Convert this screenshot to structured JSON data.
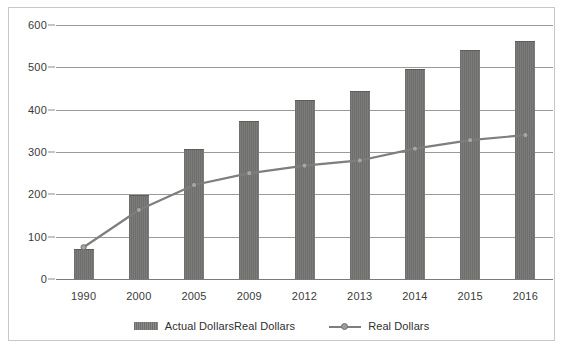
{
  "chart_data": {
    "type": "bar",
    "title": "",
    "subtitle": "",
    "xlabel": "",
    "ylabel": "",
    "categories": [
      "1990",
      "2000",
      "2005",
      "2009",
      "2012",
      "2013",
      "2014",
      "2015",
      "2016"
    ],
    "ylim": [
      0,
      600
    ],
    "yticks": [
      0,
      100,
      200,
      300,
      400,
      500,
      600
    ],
    "ytick_labels": [
      "0",
      "100",
      "200",
      "300",
      "400",
      "500",
      "600"
    ],
    "grid": true,
    "legend_position": "bottom",
    "series": [
      {
        "name": "Actual DollarsReal Dollars",
        "kind": "bar",
        "color": "#70706f",
        "values": [
          72,
          198,
          308,
          373,
          422,
          445,
          497,
          540,
          563
        ]
      },
      {
        "name": "Real Dollars",
        "kind": "line",
        "color": "#7e7e7d",
        "marker": "circle",
        "values": [
          75,
          163,
          222,
          250,
          268,
          280,
          308,
          328,
          340
        ]
      }
    ]
  },
  "legend": {
    "items": [
      {
        "label": "Actual DollarsReal Dollars",
        "swatch": "bar-swatch"
      },
      {
        "label": "Real Dollars",
        "swatch": "line-marker-swatch"
      }
    ]
  },
  "colors": {
    "bar": "#70706f",
    "line": "#7e7e7d",
    "grid": "#9a9a9a",
    "axis": "#7a7a7a",
    "frame": "#c8c8c8",
    "text": "#3a3a3a",
    "background": "#ffffff"
  }
}
